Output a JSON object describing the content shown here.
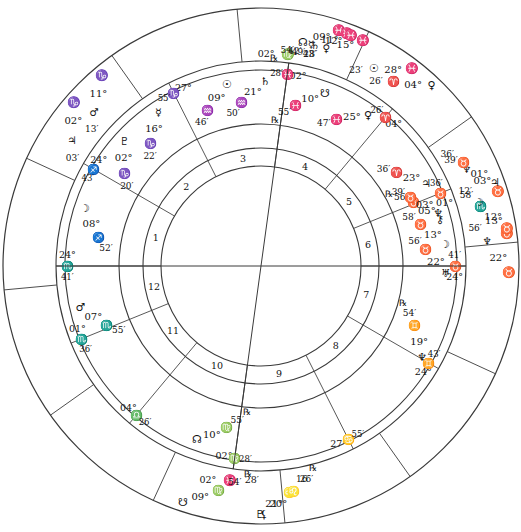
{
  "chart": {
    "type": "astrological-wheel",
    "center": {
      "x": 261,
      "y": 266
    },
    "radii": {
      "outer": 258,
      "zodiac_inner": 205,
      "planet_outer": 196,
      "planet_inner": 142,
      "house_outer": 118,
      "house_inner": 100
    },
    "colors": {
      "line": "#3a3a3a",
      "text": "#111111",
      "background": "#ffffff"
    }
  },
  "glyphs": {
    "aries": "♈",
    "taurus": "♉",
    "gemini": "♊",
    "cancer": "♋",
    "leo": "♌",
    "virgo": "♍",
    "libra": "♎",
    "scorpio": "♏",
    "sagittarius": "♐",
    "capricorn": "♑",
    "aquarius": "♒",
    "pisces": "♓",
    "sun": "☉",
    "moon": "☽",
    "mercury": "☿",
    "venus": "♀",
    "mars": "♂",
    "jupiter": "♃",
    "saturn": "♄",
    "uranus": "♅",
    "neptune": "♆",
    "pluto": "♇",
    "chiron": "⚷",
    "node_north": "☊",
    "node_south": "☋",
    "lilith": "⚸",
    "retrograde": "℞",
    "degree": "°",
    "minute": "′"
  },
  "zodiac_signs": [
    {
      "name": "Aries",
      "glyph": "♈"
    },
    {
      "name": "Taurus",
      "glyph": "♉"
    },
    {
      "name": "Gemini",
      "glyph": "♊"
    },
    {
      "name": "Cancer",
      "glyph": "♋"
    },
    {
      "name": "Leo",
      "glyph": "♌"
    },
    {
      "name": "Virgo",
      "glyph": "♍"
    },
    {
      "name": "Libra",
      "glyph": "♎"
    },
    {
      "name": "Scorpio",
      "glyph": "♏"
    },
    {
      "name": "Sagittarius",
      "glyph": "♐"
    },
    {
      "name": "Capricorn",
      "glyph": "♑"
    },
    {
      "name": "Aquarius",
      "glyph": "♒"
    },
    {
      "name": "Pisces",
      "glyph": "♓"
    }
  ],
  "house_numbers": [
    "1",
    "2",
    "3",
    "4",
    "5",
    "6",
    "7",
    "8",
    "9",
    "10",
    "11",
    "12"
  ],
  "house_cusps": [
    {
      "house": "1",
      "deg": "24°",
      "sign": "♏",
      "sign_name": "Scorpio",
      "min": "41′",
      "label": "ASC"
    },
    {
      "house": "2",
      "deg": "24°",
      "sign": "♐",
      "sign_name": "Sagittarius",
      "min": "43′",
      "label": ""
    },
    {
      "house": "3",
      "deg": "27°",
      "sign": "♑",
      "sign_name": "Capricorn",
      "min": "55′",
      "label": ""
    },
    {
      "house": "4",
      "deg": "02°",
      "sign": "♓",
      "sign_name": "Pisces",
      "min": "28′",
      "label": "IC"
    },
    {
      "house": "5",
      "deg": "04°",
      "sign": "♈",
      "sign_name": "Aries",
      "min": "26′",
      "label": ""
    },
    {
      "house": "6",
      "deg": "01°",
      "sign": "♉",
      "sign_name": "Taurus",
      "min": "36′",
      "label": ""
    },
    {
      "house": "7",
      "deg": "24°",
      "sign": "♉",
      "sign_name": "Taurus",
      "min": "41′",
      "label": "DSC"
    },
    {
      "house": "8",
      "deg": "24°",
      "sign": "♊",
      "sign_name": "Gemini",
      "min": "43′",
      "label": ""
    },
    {
      "house": "9",
      "deg": "27°",
      "sign": "♋",
      "sign_name": "Cancer",
      "min": "55′",
      "label": ""
    },
    {
      "house": "10",
      "deg": "02°",
      "sign": "♍",
      "sign_name": "Virgo",
      "min": "28′",
      "label": "MC"
    },
    {
      "house": "11",
      "deg": "04°",
      "sign": "♎",
      "sign_name": "Libra",
      "min": "26′",
      "label": ""
    },
    {
      "house": "12",
      "deg": "01°",
      "sign": "♏",
      "sign_name": "Scorpio",
      "min": "36′",
      "label": ""
    }
  ],
  "planets_inner": [
    {
      "name": "North Node",
      "glyph": "☊",
      "deg": "10°",
      "sign": "♍",
      "sign_name": "Virgo",
      "min": "55′",
      "retro": "℞"
    },
    {
      "name": "Chiron",
      "glyph": "⚷",
      "deg": "05°",
      "sign": "♉",
      "sign_name": "Taurus",
      "min": "56′",
      "retro": "℞"
    },
    {
      "name": "Neptune",
      "glyph": "♆",
      "deg": "19°",
      "sign": "♊",
      "sign_name": "Gemini",
      "min": "54′",
      "retro": "℞"
    },
    {
      "name": "Uranus",
      "glyph": "♅",
      "deg": "22°",
      "sign": "♉",
      "sign_name": "Taurus",
      "min": "56′",
      "retro": ""
    },
    {
      "name": "Moon",
      "glyph": "☽",
      "deg": "13°",
      "sign": "♉",
      "sign_name": "Taurus",
      "min": "58′",
      "retro": ""
    },
    {
      "name": "Venus",
      "glyph": "♀",
      "deg": "25°",
      "sign": "♓",
      "sign_name": "Pisces",
      "min": "47′",
      "retro": ""
    },
    {
      "name": "South Node",
      "glyph": "☋",
      "deg": "10°",
      "sign": "♓",
      "sign_name": "Pisces",
      "min": "55′",
      "retro": "℞"
    },
    {
      "name": "Saturn",
      "glyph": "♄",
      "deg": "21°",
      "sign": "♒",
      "sign_name": "Aquarius",
      "min": "50′",
      "retro": ""
    },
    {
      "name": "Sun",
      "glyph": "☉",
      "deg": "09°",
      "sign": "♒",
      "sign_name": "Aquarius",
      "min": "46′",
      "retro": ""
    },
    {
      "name": "Mercury",
      "glyph": "☿",
      "deg": "16°",
      "sign": "♑",
      "sign_name": "Capricorn",
      "min": "22′",
      "retro": ""
    },
    {
      "name": "Pluto",
      "glyph": "♇",
      "deg": "02°",
      "sign": "♑",
      "sign_name": "Capricorn",
      "min": "20′",
      "retro": ""
    },
    {
      "name": "Mars",
      "glyph": "♂",
      "deg": "07°",
      "sign": "♏",
      "sign_name": "Scorpio",
      "min": "55′",
      "retro": ""
    },
    {
      "name": "Moon-Sag",
      "glyph": "☽",
      "deg": "08°",
      "sign": "♐",
      "sign_name": "Sagittarius",
      "min": "52′",
      "retro": ""
    },
    {
      "name": "Jupiter",
      "glyph": "♃",
      "deg": "23°",
      "sign": "♈",
      "sign_name": "Aries",
      "min": "36′",
      "retro": ""
    },
    {
      "name": "Neptune-Tau",
      "glyph": "♆",
      "deg": "03°",
      "sign": "♉",
      "sign_name": "Taurus",
      "min": "39′",
      "retro": ""
    }
  ],
  "planets_outer": [
    {
      "name": "South Node",
      "glyph": "☋",
      "deg": "09°",
      "sign": "♍",
      "sign_name": "Virgo",
      "min": "54′",
      "retro": "℞"
    },
    {
      "name": "Pluto",
      "glyph": "♇",
      "deg": "21°",
      "sign": "♌",
      "sign_name": "Leo",
      "min": "16′",
      "retro": "℞"
    },
    {
      "name": "Lilith",
      "glyph": "⚸",
      "deg": "20°",
      "sign": "♌",
      "sign_name": "Leo",
      "min": "26′",
      "retro": ""
    },
    {
      "name": "Uranus",
      "glyph": "♉",
      "deg": "22°",
      "sign": "♆",
      "sign_name": "Taurus",
      "min": "56′",
      "retro": ""
    },
    {
      "name": "Moon",
      "glyph": "♉",
      "deg": "13°",
      "sign": "♏",
      "sign_name": "Taurus",
      "min": "58′",
      "retro": ""
    },
    {
      "name": "Mercury",
      "glyph": "♉",
      "deg": "12°",
      "sign": "☽",
      "sign_name": "Taurus",
      "min": "12′",
      "retro": ""
    },
    {
      "name": "Neptune",
      "glyph": "♉",
      "deg": "03°",
      "sign": "♆",
      "sign_name": "Taurus",
      "min": "39′",
      "retro": ""
    },
    {
      "name": "Jupiter",
      "glyph": "♃",
      "deg": "01°",
      "sign": "♉",
      "sign_name": "Taurus",
      "min": "36′",
      "retro": ""
    },
    {
      "name": "Venus",
      "glyph": "♀",
      "deg": "04°",
      "sign": "♈",
      "sign_name": "Aries",
      "min": "26′",
      "retro": ""
    },
    {
      "name": "Pisces-1",
      "glyph": "♓",
      "deg": "09°",
      "sign": "☊",
      "sign_name": "Pisces",
      "min": "54′",
      "retro": "℞"
    },
    {
      "name": "Pisces-2",
      "glyph": "♓",
      "deg": "11°",
      "sign": "☿",
      "sign_name": "Pisces",
      "min": "42′",
      "retro": ""
    },
    {
      "name": "Pisces-3",
      "glyph": "♓",
      "deg": "12°",
      "sign": "♄",
      "sign_name": "Pisces",
      "min": "49′",
      "retro": ""
    },
    {
      "name": "Pisces-4",
      "glyph": "♓",
      "deg": "15°",
      "sign": "♀",
      "sign_name": "Pisces",
      "min": "43′",
      "retro": ""
    },
    {
      "name": "Pisces-5",
      "glyph": "♓",
      "deg": "28°",
      "sign": "☉",
      "sign_name": "Pisces",
      "min": "23′",
      "retro": ""
    },
    {
      "name": "Capricorn-1",
      "glyph": "♑",
      "deg": "02°",
      "sign": "♃",
      "sign_name": "Capricorn",
      "min": "03′",
      "retro": ""
    },
    {
      "name": "Capricorn-2",
      "glyph": "♑",
      "deg": "11°",
      "sign": "♂",
      "sign_name": "Capricorn",
      "min": "13′",
      "retro": ""
    }
  ],
  "annotations": {
    "mc_label": "02° ♍ 28′",
    "ic_label": "02° ♓ 28′",
    "asc_label": "24° ♏ 41′",
    "dsc_label": "24° ♉ 41′"
  }
}
